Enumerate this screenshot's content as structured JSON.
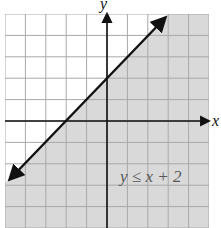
{
  "figure": {
    "axis_labels": {
      "x": "x",
      "y": "y"
    },
    "inequality_label": "y ≤ x + 2",
    "boundary_line": {
      "slope": 1,
      "intercept": 2,
      "style": "solid"
    },
    "shaded_region": "below line",
    "grid": {
      "x_range": [
        -5,
        5
      ],
      "y_range": [
        -5,
        5
      ],
      "step": 1
    },
    "colors": {
      "shade": "#d9d9d9",
      "grid": "#a8a8a8",
      "line": "#111111",
      "background": "#ffffff"
    }
  }
}
